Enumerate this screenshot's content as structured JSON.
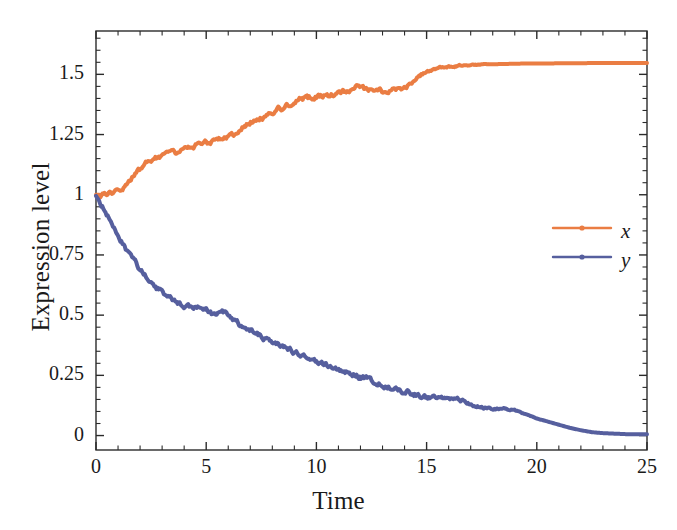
{
  "chart_data": {
    "type": "line",
    "title": "",
    "subtitle": "",
    "xlabel": "Time",
    "ylabel": "Expression level",
    "xlim": [
      0,
      25
    ],
    "ylim": [
      -0.06,
      1.68
    ],
    "xticks": [
      "0",
      "5",
      "10",
      "15",
      "20",
      "25"
    ],
    "xtick_values": [
      0,
      5,
      10,
      15,
      20,
      25
    ],
    "yticks": [
      "0",
      "0.25",
      "0.5",
      "0.75",
      "1",
      "1.25",
      "1.5"
    ],
    "ytick_values": [
      0,
      0.25,
      0.5,
      0.75,
      1,
      1.25,
      1.5
    ],
    "grid": false,
    "minor_ticks": true,
    "frame": true,
    "legend_position": "right-middle",
    "legend": [
      {
        "name": "x",
        "color": "#EA7D43",
        "marker": "line-with-dot"
      },
      {
        "name": "y",
        "color": "#565F9E",
        "marker": "line-with-dot"
      }
    ],
    "series": [
      {
        "name": "x",
        "color": "#EA7D43",
        "linewidth": 4,
        "x": [
          0,
          0.25,
          0.5,
          0.75,
          1,
          1.25,
          1.5,
          1.75,
          2,
          2.25,
          2.5,
          2.75,
          3,
          3.25,
          3.5,
          3.75,
          4,
          4.25,
          4.5,
          4.75,
          5,
          5.25,
          5.5,
          5.75,
          6,
          6.25,
          6.5,
          6.75,
          7,
          7.25,
          7.5,
          7.75,
          8,
          8.25,
          8.5,
          8.75,
          9,
          9.25,
          9.5,
          9.75,
          10,
          10.25,
          10.5,
          10.75,
          11,
          11.25,
          11.5,
          11.75,
          12,
          12.25,
          12.5,
          12.75,
          13,
          13.25,
          13.5,
          13.75,
          14,
          14.25,
          14.5,
          14.75,
          15,
          15.5,
          16,
          16.5,
          17,
          17.5,
          18,
          18.5,
          19,
          19.5,
          20,
          20.5,
          21,
          21.5,
          22,
          22.5,
          23,
          23.5,
          24,
          24.5,
          25
        ],
        "y": [
          1.0,
          1.0,
          1.0,
          1.005,
          1.01,
          1.025,
          1.05,
          1.08,
          1.105,
          1.125,
          1.145,
          1.155,
          1.165,
          1.168,
          1.17,
          1.175,
          1.185,
          1.195,
          1.205,
          1.21,
          1.215,
          1.22,
          1.235,
          1.24,
          1.245,
          1.25,
          1.262,
          1.29,
          1.3,
          1.305,
          1.315,
          1.33,
          1.345,
          1.355,
          1.36,
          1.375,
          1.385,
          1.395,
          1.4,
          1.403,
          1.405,
          1.41,
          1.412,
          1.415,
          1.425,
          1.43,
          1.44,
          1.45,
          1.445,
          1.435,
          1.43,
          1.428,
          1.43,
          1.435,
          1.44,
          1.437,
          1.442,
          1.46,
          1.48,
          1.5,
          1.515,
          1.525,
          1.53,
          1.535,
          1.538,
          1.54,
          1.542,
          1.543,
          1.544,
          1.545,
          1.545,
          1.545,
          1.546,
          1.546,
          1.546,
          1.547,
          1.547,
          1.547,
          1.547,
          1.547,
          1.547
        ]
      },
      {
        "name": "y",
        "color": "#565F9E",
        "linewidth": 4,
        "x": [
          0,
          0.25,
          0.5,
          0.75,
          1,
          1.25,
          1.5,
          1.75,
          2,
          2.25,
          2.5,
          2.75,
          3,
          3.25,
          3.5,
          3.75,
          4,
          4.25,
          4.5,
          4.75,
          5,
          5.25,
          5.5,
          5.75,
          6,
          6.25,
          6.5,
          6.75,
          7,
          7.25,
          7.5,
          7.75,
          8,
          8.25,
          8.5,
          8.75,
          9,
          9.25,
          9.5,
          9.75,
          10,
          10.5,
          11,
          11.5,
          12,
          12.5,
          13,
          13.5,
          14,
          14.5,
          15,
          15.5,
          16,
          16.5,
          17,
          17.5,
          18,
          18.5,
          19,
          19.5,
          20,
          20.5,
          21,
          21.5,
          22,
          22.5,
          23,
          23.5,
          24,
          24.5,
          25
        ],
        "y": [
          0.995,
          0.96,
          0.915,
          0.87,
          0.825,
          0.79,
          0.755,
          0.72,
          0.69,
          0.665,
          0.64,
          0.615,
          0.595,
          0.575,
          0.56,
          0.548,
          0.54,
          0.535,
          0.532,
          0.53,
          0.522,
          0.505,
          0.508,
          0.512,
          0.5,
          0.478,
          0.462,
          0.45,
          0.44,
          0.428,
          0.415,
          0.4,
          0.39,
          0.378,
          0.368,
          0.36,
          0.345,
          0.332,
          0.325,
          0.32,
          0.31,
          0.292,
          0.275,
          0.258,
          0.242,
          0.228,
          0.212,
          0.198,
          0.185,
          0.172,
          0.158,
          0.152,
          0.158,
          0.148,
          0.132,
          0.118,
          0.108,
          0.112,
          0.105,
          0.088,
          0.072,
          0.058,
          0.045,
          0.032,
          0.022,
          0.014,
          0.01,
          0.008,
          0.006,
          0.005,
          0.005
        ]
      }
    ]
  },
  "axes": {
    "xlabel": "Time",
    "ylabel": "Expression level"
  },
  "legend": {
    "entry_x": "x",
    "entry_y": "y"
  }
}
